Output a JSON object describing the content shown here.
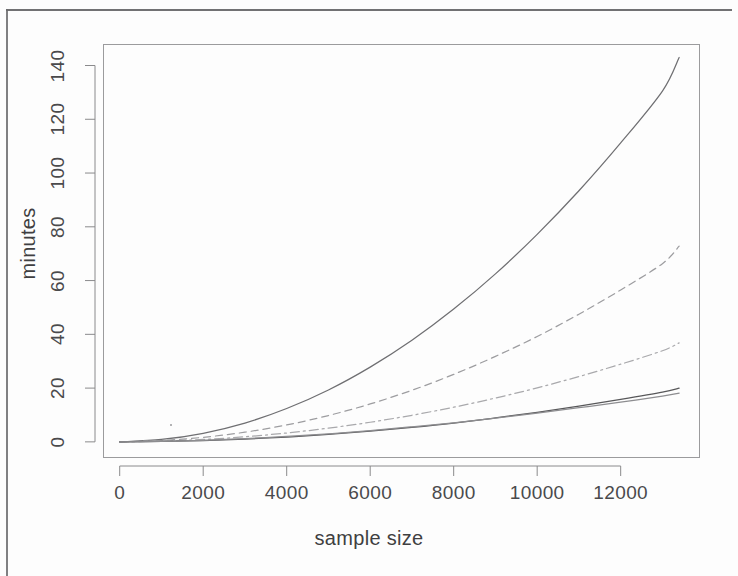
{
  "figure": {
    "kind": "scanned-r-plot",
    "background_color": "#fdfdfd",
    "ink_color": "#4a4a4c"
  },
  "axes": {
    "x_label": "sample size",
    "y_label": "minutes",
    "x_ticks": [
      "0",
      "2000",
      "4000",
      "6000",
      "8000",
      "10000",
      "12000"
    ],
    "y_ticks": [
      "0",
      "20",
      "40",
      "60",
      "80",
      "100",
      "120",
      "140"
    ]
  },
  "chart_data": {
    "type": "line",
    "title": "",
    "subtitle": "",
    "xlabel": "sample size",
    "ylabel": "minutes",
    "xlim": [
      -400,
      13900
    ],
    "ylim": [
      -6,
      148
    ],
    "xticks": [
      0,
      2000,
      4000,
      6000,
      8000,
      10000,
      12000
    ],
    "yticks": [
      0,
      20,
      40,
      60,
      80,
      100,
      120,
      140
    ],
    "grid": false,
    "legend": "none",
    "annotations": [
      {
        "label": "scan-speck",
        "x": 2000,
        "y": 7
      }
    ],
    "x": [
      0,
      1000,
      2000,
      3000,
      4000,
      5000,
      6000,
      7000,
      8000,
      9000,
      10000,
      11000,
      12000,
      13000,
      13400
    ],
    "series": [
      {
        "name": "curve-1",
        "style": "solid",
        "color": "#6f6f72",
        "values": [
          0.0,
          0.9,
          3.2,
          7.0,
          12.4,
          19.3,
          27.8,
          37.8,
          49.4,
          62.5,
          77.2,
          93.4,
          111.2,
          130.5,
          143.0
        ]
      },
      {
        "name": "curve-2",
        "style": "dashed",
        "color": "#9d9da0",
        "values": [
          0.0,
          0.5,
          1.7,
          3.6,
          6.3,
          9.8,
          14.1,
          19.2,
          25.1,
          31.8,
          39.2,
          47.5,
          56.5,
          66.3,
          72.8
        ]
      },
      {
        "name": "curve-3",
        "style": "dashdot",
        "color": "#a9a9ac",
        "values": [
          0.0,
          0.3,
          0.9,
          1.9,
          3.3,
          5.1,
          7.3,
          9.9,
          12.9,
          16.3,
          20.1,
          24.3,
          28.9,
          33.9,
          36.8
        ]
      },
      {
        "name": "curve-4",
        "style": "solid",
        "color": "#58585a",
        "values": [
          0.0,
          0.15,
          0.5,
          1.05,
          1.8,
          2.8,
          4.0,
          5.4,
          7.0,
          8.9,
          11.0,
          13.3,
          15.8,
          18.5,
          20.0
        ]
      },
      {
        "name": "curve-5",
        "style": "solid",
        "color": "#8d8d90",
        "values": [
          0.0,
          0.2,
          0.6,
          1.2,
          2.0,
          3.0,
          4.2,
          5.6,
          7.1,
          8.8,
          10.7,
          12.7,
          14.8,
          17.0,
          18.1
        ]
      }
    ]
  }
}
